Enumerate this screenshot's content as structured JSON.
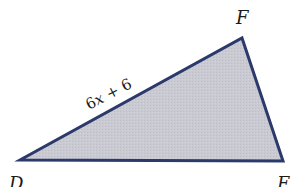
{
  "figure": {
    "type": "triangle",
    "vertices": {
      "D": {
        "label": "D",
        "x": 20,
        "y": 160
      },
      "E": {
        "label": "E",
        "x": 283,
        "y": 161
      },
      "F": {
        "label": "F",
        "x": 242,
        "y": 38
      }
    },
    "side_labels": {
      "DF": {
        "prefix": "6",
        "variable": "x",
        "suffix": " + 6"
      }
    },
    "colors": {
      "stroke": "#2b3a6b",
      "fill": "#c9c9d1"
    }
  }
}
